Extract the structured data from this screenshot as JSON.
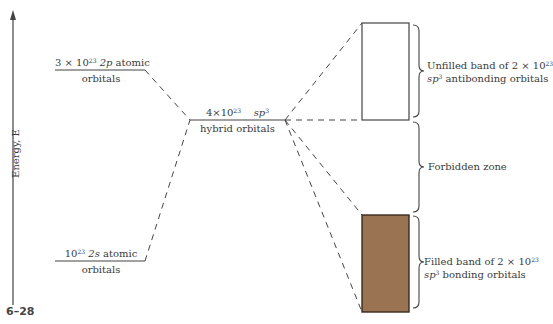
{
  "figure": {
    "number": "6–28",
    "axis": {
      "label": "Energy, E"
    },
    "levels": {
      "p_atomic": {
        "line1_pre": "3 × 10",
        "line1_exp": "23",
        "line1_it": "2p",
        "line1_post": " atomic",
        "line2": "orbitals"
      },
      "hybrid": {
        "line1_pre": "4×10",
        "line1_exp": "23",
        "line1_it": "sp",
        "line1_it_exp": "3",
        "line2": "hybrid orbitals"
      },
      "s_atomic": {
        "line1_pre": "10",
        "line1_exp": "23",
        "line1_it": "2s",
        "line1_post": " atomic",
        "line2": "orbitals"
      }
    },
    "bands": {
      "unfilled": {
        "line1_pre": "Unfilled band of 2 × 10",
        "line1_exp": "23",
        "line2_it": "sp",
        "line2_exp": "3",
        "line2_post": " antibonding orbitals",
        "fill": "#ffffff"
      },
      "forbidden": {
        "label": "Forbidden zone"
      },
      "filled": {
        "line1_pre": "Filled band of 2 × 10",
        "line1_exp": "23",
        "line2_it": "sp",
        "line2_exp": "3",
        "line2_post": " bonding orbitals",
        "fill": "#9a7452"
      }
    }
  }
}
